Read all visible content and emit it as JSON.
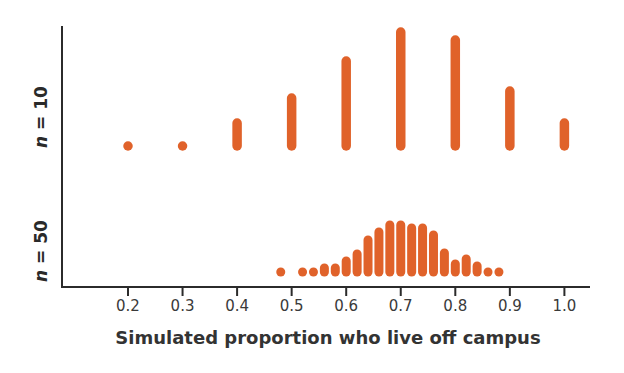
{
  "chart_data": {
    "type": "dot-stack",
    "title": "",
    "xlabel": "Simulated proportion who live off campus",
    "ylabel": "",
    "xlim": [
      0.1,
      1.05
    ],
    "x_ticks": [
      0.2,
      0.3,
      0.4,
      0.5,
      0.6,
      0.7,
      0.8,
      0.9,
      1.0
    ],
    "x_tick_labels": [
      "0.2",
      "0.3",
      "0.4",
      "0.5",
      "0.6",
      "0.7",
      "0.8",
      "0.9",
      "1.0"
    ],
    "grid": false,
    "legend": null,
    "color": "#e0622a",
    "series": [
      {
        "name": "n = 10",
        "panel_label_var": "n",
        "panel_label_rest": " = 10",
        "x": [
          0.2,
          0.3,
          0.4,
          0.5,
          0.6,
          0.7,
          0.8,
          0.9,
          1.0
        ],
        "relative_height_px": [
          0,
          0,
          23,
          48,
          85,
          114,
          106,
          55,
          23
        ],
        "approx_count": [
          1,
          1,
          4,
          9,
          15,
          20,
          19,
          10,
          4
        ]
      },
      {
        "name": "n = 50",
        "panel_label_var": "n",
        "panel_label_rest": " = 50",
        "x": [
          0.48,
          0.52,
          0.54,
          0.56,
          0.58,
          0.6,
          0.62,
          0.64,
          0.66,
          0.68,
          0.7,
          0.72,
          0.74,
          0.76,
          0.78,
          0.8,
          0.82,
          0.84,
          0.86,
          0.88
        ],
        "relative_height_px": [
          0,
          0,
          0,
          4,
          4,
          11,
          18,
          32,
          40,
          47,
          47,
          44,
          44,
          37,
          19,
          8,
          13,
          6,
          0,
          0
        ],
        "approx_count": [
          1,
          1,
          1,
          2,
          2,
          3,
          4,
          7,
          9,
          10,
          10,
          9,
          9,
          8,
          4,
          2,
          3,
          2,
          1,
          1
        ]
      }
    ]
  }
}
